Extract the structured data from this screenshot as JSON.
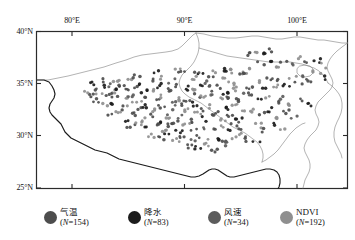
{
  "figure": {
    "type": "scatter-map",
    "region": "Tibetan Plateau",
    "background_color": "#ffffff",
    "frame_color": "#222222"
  },
  "axes": {
    "x_ticks": [
      {
        "label": "80°E",
        "value": 80
      },
      {
        "label": "90°E",
        "value": 90
      },
      {
        "label": "100°E",
        "value": 100
      }
    ],
    "y_ticks": [
      {
        "label": "40°N",
        "value": 40
      },
      {
        "label": "35°N",
        "value": 35
      },
      {
        "label": "30°N",
        "value": 30
      },
      {
        "label": "25°N",
        "value": 25
      }
    ],
    "xlim": [
      73.5,
      104.5
    ],
    "ylim": [
      24.0,
      40.5
    ]
  },
  "legend": [
    {
      "label": "气温",
      "count_text": "(N=154)",
      "n": 154,
      "color": "#4d4d4d",
      "script": "han"
    },
    {
      "label": "降水",
      "count_text": "(N=83)",
      "n": 83,
      "color": "#1c1c1c",
      "script": "han"
    },
    {
      "label": "风速",
      "count_text": "(N=34)",
      "n": 34,
      "color": "#5c5c5c",
      "script": "han"
    },
    {
      "label": "NDVI",
      "count_text": "(N=192)",
      "n": 192,
      "color": "#8f8f8f",
      "script": "latin"
    }
  ],
  "chart_data": {
    "type": "scatter",
    "title": "",
    "xlabel": "",
    "ylabel": "",
    "xlim": [
      73.5,
      104.5
    ],
    "ylim": [
      24.0,
      40.5
    ],
    "grid": false,
    "legend_position": "bottom",
    "series": [
      {
        "name": "气温",
        "color": "#4d4d4d",
        "n": 154
      },
      {
        "name": "降水",
        "color": "#1c1c1c",
        "n": 83
      },
      {
        "name": "风速",
        "color": "#5c5c5c",
        "n": 34
      },
      {
        "name": "NDVI",
        "color": "#8f8f8f",
        "n": 192
      }
    ],
    "points": [
      [
        79.3,
        34.4,
        0
      ],
      [
        79.8,
        34.1,
        3
      ],
      [
        80.2,
        34.6,
        1
      ],
      [
        80.6,
        34.0,
        0
      ],
      [
        81.0,
        34.3,
        3
      ],
      [
        81.4,
        33.8,
        0
      ],
      [
        81.8,
        34.5,
        1
      ],
      [
        82.2,
        33.5,
        3
      ],
      [
        82.6,
        34.2,
        0
      ],
      [
        83.0,
        33.9,
        2
      ],
      [
        83.4,
        34.7,
        0
      ],
      [
        83.8,
        33.3,
        3
      ],
      [
        84.2,
        34.1,
        1
      ],
      [
        84.6,
        33.7,
        0
      ],
      [
        85.0,
        34.4,
        3
      ],
      [
        85.4,
        33.2,
        0
      ],
      [
        85.8,
        34.8,
        1
      ],
      [
        86.2,
        33.6,
        3
      ],
      [
        86.6,
        34.3,
        0
      ],
      [
        87.0,
        33.0,
        2
      ],
      [
        87.4,
        34.9,
        0
      ],
      [
        87.8,
        33.4,
        3
      ],
      [
        88.2,
        34.6,
        1
      ],
      [
        88.6,
        33.1,
        0
      ],
      [
        89.0,
        34.2,
        3
      ],
      [
        89.4,
        33.8,
        0
      ],
      [
        89.8,
        35.0,
        1
      ],
      [
        90.2,
        33.5,
        3
      ],
      [
        90.6,
        34.5,
        0
      ],
      [
        91.0,
        33.9,
        2
      ],
      [
        91.4,
        34.7,
        0
      ],
      [
        91.8,
        33.3,
        3
      ],
      [
        92.2,
        34.1,
        1
      ],
      [
        92.6,
        33.6,
        0
      ],
      [
        93.0,
        34.4,
        3
      ],
      [
        79.6,
        33.2,
        0
      ],
      [
        80.4,
        32.8,
        3
      ],
      [
        81.2,
        33.0,
        1
      ],
      [
        82.0,
        32.5,
        0
      ],
      [
        82.8,
        32.9,
        3
      ],
      [
        83.6,
        32.3,
        0
      ],
      [
        84.4,
        32.7,
        1
      ],
      [
        85.2,
        32.1,
        3
      ],
      [
        86.0,
        32.6,
        0
      ],
      [
        86.8,
        32.0,
        2
      ],
      [
        87.6,
        32.8,
        0
      ],
      [
        88.4,
        32.2,
        3
      ],
      [
        89.2,
        32.9,
        1
      ],
      [
        90.0,
        32.4,
        0
      ],
      [
        90.8,
        32.7,
        3
      ],
      [
        91.6,
        32.1,
        0
      ],
      [
        92.4,
        32.5,
        1
      ],
      [
        93.2,
        32.9,
        3
      ],
      [
        93.8,
        33.4,
        0
      ],
      [
        94.4,
        33.8,
        2
      ],
      [
        80.8,
        31.6,
        0
      ],
      [
        81.6,
        31.9,
        3
      ],
      [
        82.4,
        31.3,
        1
      ],
      [
        83.2,
        31.8,
        0
      ],
      [
        84.0,
        31.2,
        3
      ],
      [
        84.8,
        31.7,
        0
      ],
      [
        85.6,
        31.1,
        1
      ],
      [
        86.4,
        31.5,
        3
      ],
      [
        87.2,
        31.0,
        0
      ],
      [
        88.0,
        31.6,
        2
      ],
      [
        88.8,
        31.2,
        0
      ],
      [
        89.6,
        31.8,
        3
      ],
      [
        90.4,
        31.3,
        1
      ],
      [
        91.2,
        31.7,
        0
      ],
      [
        92.0,
        31.1,
        3
      ],
      [
        92.8,
        31.6,
        0
      ],
      [
        93.6,
        31.2,
        1
      ],
      [
        94.2,
        31.9,
        3
      ],
      [
        82.9,
        30.6,
        0
      ],
      [
        83.7,
        30.9,
        3
      ],
      [
        84.5,
        30.3,
        1
      ],
      [
        85.3,
        30.8,
        0
      ],
      [
        86.1,
        30.2,
        3
      ],
      [
        86.9,
        30.7,
        0
      ],
      [
        87.7,
        30.1,
        1
      ],
      [
        88.5,
        30.6,
        3
      ],
      [
        89.3,
        30.0,
        0
      ],
      [
        90.1,
        30.5,
        2
      ],
      [
        90.9,
        30.1,
        0
      ],
      [
        91.7,
        30.6,
        3
      ],
      [
        92.5,
        30.2,
        1
      ],
      [
        93.3,
        30.7,
        0
      ],
      [
        85.0,
        29.5,
        3
      ],
      [
        85.8,
        29.2,
        0
      ],
      [
        86.6,
        29.6,
        1
      ],
      [
        87.4,
        29.1,
        3
      ],
      [
        88.2,
        29.5,
        0
      ],
      [
        89.0,
        29.0,
        2
      ],
      [
        89.8,
        29.4,
        0
      ],
      [
        90.6,
        28.9,
        3
      ],
      [
        91.4,
        29.3,
        1
      ],
      [
        92.2,
        28.8,
        0
      ],
      [
        93.0,
        29.2,
        3
      ],
      [
        88.9,
        28.4,
        0
      ],
      [
        89.7,
        28.2,
        1
      ],
      [
        90.5,
        28.5,
        3
      ],
      [
        91.3,
        28.1,
        0
      ],
      [
        92.1,
        28.6,
        2
      ],
      [
        94.8,
        34.6,
        0
      ],
      [
        95.4,
        35.1,
        3
      ],
      [
        96.0,
        34.3,
        1
      ],
      [
        96.6,
        35.4,
        0
      ],
      [
        97.2,
        34.8,
        3
      ],
      [
        97.8,
        35.6,
        0
      ],
      [
        98.4,
        35.0,
        1
      ],
      [
        99.0,
        35.8,
        3
      ],
      [
        99.6,
        35.2,
        0
      ],
      [
        100.2,
        36.0,
        2
      ],
      [
        100.8,
        35.4,
        0
      ],
      [
        101.4,
        36.2,
        3
      ],
      [
        102.0,
        35.6,
        1
      ],
      [
        95.0,
        36.8,
        3
      ],
      [
        95.8,
        37.2,
        0
      ],
      [
        96.6,
        37.5,
        1
      ],
      [
        97.4,
        37.0,
        3
      ],
      [
        98.2,
        37.4,
        0
      ],
      [
        99.0,
        37.1,
        2
      ],
      [
        99.8,
        37.6,
        3
      ],
      [
        100.6,
        37.2,
        0
      ],
      [
        101.4,
        37.5,
        1
      ],
      [
        102.2,
        36.9,
        3
      ],
      [
        94.6,
        38.2,
        0
      ],
      [
        95.4,
        38.5,
        3
      ],
      [
        96.2,
        38.0,
        1
      ],
      [
        97.0,
        38.6,
        0
      ],
      [
        94.2,
        36.1,
        3
      ],
      [
        95.0,
        33.8,
        0
      ],
      [
        95.8,
        33.2,
        1
      ],
      [
        96.6,
        33.6,
        3
      ],
      [
        97.4,
        33.0,
        0
      ],
      [
        98.2,
        33.5,
        2
      ],
      [
        99.0,
        32.9,
        3
      ],
      [
        99.8,
        33.4,
        0
      ],
      [
        100.6,
        32.8,
        1
      ],
      [
        95.2,
        32.2,
        3
      ],
      [
        96.0,
        31.8,
        0
      ],
      [
        96.8,
        32.3,
        1
      ],
      [
        97.6,
        31.6,
        3
      ],
      [
        98.4,
        32.0,
        0
      ],
      [
        99.2,
        31.4,
        2
      ],
      [
        95.6,
        30.6,
        3
      ],
      [
        96.4,
        30.2,
        0
      ],
      [
        97.2,
        30.7,
        1
      ],
      [
        98.0,
        30.1,
        3
      ],
      [
        94.0,
        30.4,
        0
      ],
      [
        93.5,
        29.6,
        3
      ],
      [
        94.6,
        29.2,
        0
      ],
      [
        95.4,
        29.0,
        1
      ],
      [
        92.0,
        35.5,
        3
      ],
      [
        91.0,
        35.8,
        0
      ],
      [
        90.0,
        36.0,
        1
      ],
      [
        89.0,
        35.6,
        3
      ],
      [
        88.0,
        36.1,
        0
      ],
      [
        87.0,
        35.3,
        2
      ],
      [
        86.0,
        35.7,
        3
      ],
      [
        85.0,
        35.4,
        0
      ],
      [
        84.0,
        35.1,
        1
      ],
      [
        83.0,
        35.3,
        3
      ],
      [
        82.0,
        35.0,
        0
      ],
      [
        81.0,
        34.9,
        2
      ],
      [
        93.0,
        36.3,
        3
      ],
      [
        94.0,
        35.9,
        0
      ],
      [
        92.5,
        36.6,
        1
      ],
      [
        91.5,
        36.4,
        3
      ],
      [
        78.8,
        33.9,
        0
      ],
      [
        78.5,
        34.3,
        3
      ],
      [
        79.0,
        35.0,
        1
      ],
      [
        80.0,
        35.3,
        0
      ],
      [
        81.5,
        35.5,
        3
      ],
      [
        83.5,
        35.9,
        0
      ],
      [
        85.5,
        36.2,
        1
      ],
      [
        87.5,
        36.4,
        3
      ],
      [
        89.5,
        36.2,
        0
      ],
      [
        90.5,
        35.1,
        2
      ],
      [
        92.9,
        35.0,
        3
      ]
    ]
  }
}
